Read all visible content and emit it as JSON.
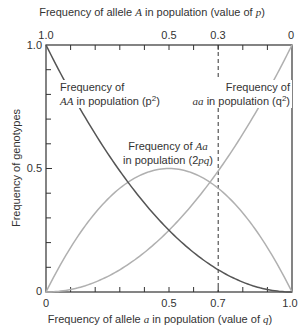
{
  "chart_data": {
    "type": "line",
    "title": "",
    "xlabel": "Frequency of allele a in population (value of q)",
    "xlabel_top": "Frequency of allele A in population (value of p)",
    "ylabel": "Frequency of genotypes",
    "xlim": [
      0,
      1
    ],
    "ylim": [
      0,
      1
    ],
    "grid": false,
    "x_ticks_bottom": [
      "0",
      "0.5",
      "0.7",
      "1.0"
    ],
    "x_ticks_top": [
      "1.0",
      "0.5",
      "0.3",
      "0"
    ],
    "y_ticks": [
      "0",
      "0.5",
      "1.0"
    ],
    "reference_line": {
      "q": 0.7,
      "p": 0.3,
      "style": "dashed"
    },
    "x": [
      0,
      0.1,
      0.2,
      0.3,
      0.4,
      0.5,
      0.6,
      0.7,
      0.8,
      0.9,
      1.0
    ],
    "series": [
      {
        "name": "Frequency of AA in population (p²)",
        "color": "#555555",
        "values": [
          1.0,
          0.81,
          0.64,
          0.49,
          0.36,
          0.25,
          0.16,
          0.09,
          0.04,
          0.01,
          0.0
        ]
      },
      {
        "name": "Frequency of Aa in population (2pq)",
        "color": "#b0b0b0",
        "values": [
          0.0,
          0.18,
          0.32,
          0.42,
          0.48,
          0.5,
          0.48,
          0.42,
          0.32,
          0.18,
          0.0
        ]
      },
      {
        "name": "Frequency of aa in population (q²)",
        "color": "#b0b0b0",
        "values": [
          0.0,
          0.01,
          0.04,
          0.09,
          0.16,
          0.25,
          0.36,
          0.49,
          0.64,
          0.81,
          1.0
        ]
      }
    ],
    "annotations": {
      "AA": {
        "line1": "Frequency of",
        "sym": "AA",
        "rest": " in population (p",
        "close": ")"
      },
      "aa": {
        "line1": "Frequency of",
        "sym": "aa",
        "rest": " in population (q",
        "close": ")"
      },
      "Aa": {
        "line1a": "Frequency of ",
        "sym": "Aa",
        "line2": "in population (2",
        "pq": "pq",
        "close": ")"
      }
    }
  },
  "labels": {
    "top_axis_pre": "Frequency of allele ",
    "top_axis_sym": "A",
    "top_axis_mid": " in population (value of ",
    "top_axis_var": "p",
    "top_axis_end": ")",
    "bottom_axis_pre": "Frequency of allele ",
    "bottom_axis_sym": "a",
    "bottom_axis_mid": " in population (value of ",
    "bottom_axis_var": "q",
    "bottom_axis_end": ")",
    "y_axis": "Frequency of genotypes",
    "sup2": "2"
  }
}
